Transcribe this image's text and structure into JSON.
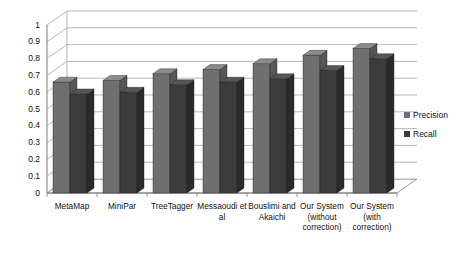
{
  "chart_data": {
    "type": "bar",
    "title": "",
    "subtitle": "",
    "xlabel": "",
    "ylabel": "",
    "ylim": [
      0,
      1
    ],
    "grid": true,
    "legend_position": "right",
    "style": "3d-grouped-column",
    "categories": [
      "MetaMap",
      "MiniPar",
      "TreeTagger",
      "Messaoudi et al",
      "Bouslimi and Akaichi",
      "Our System (without correction)",
      "Our System (with correction)"
    ],
    "ytick_labels": [
      "1",
      "0.9",
      "0.8",
      "0.7",
      "0.6",
      "0.5",
      "0.4",
      "0.3",
      "0.2",
      "0.1",
      "0"
    ],
    "ytick_values": [
      1,
      0.9,
      0.8,
      0.7,
      0.6,
      0.5,
      0.4,
      0.3,
      0.2,
      0.1,
      0
    ],
    "series": [
      {
        "name": "Precision",
        "color": "#6f6f6f",
        "side_color": "#575757",
        "top_color": "#8c8c8c",
        "values": [
          0.66,
          0.67,
          0.71,
          0.735,
          0.77,
          0.82,
          0.86
        ]
      },
      {
        "name": "Recall",
        "color": "#3b3b3b",
        "side_color": "#2a2a2a",
        "top_color": "#555555",
        "values": [
          0.59,
          0.6,
          0.645,
          0.66,
          0.68,
          0.73,
          0.8
        ]
      }
    ]
  },
  "legend": {
    "items": [
      {
        "label": "Precision",
        "color": "#6f6f6f"
      },
      {
        "label": "Recall",
        "color": "#3b3b3b"
      }
    ]
  },
  "colors": {
    "background": "#ffffff",
    "gridline": "#9a9a9a",
    "axis": "#7d7d7d",
    "floor": "#fbfbfb",
    "text": "#111111"
  }
}
